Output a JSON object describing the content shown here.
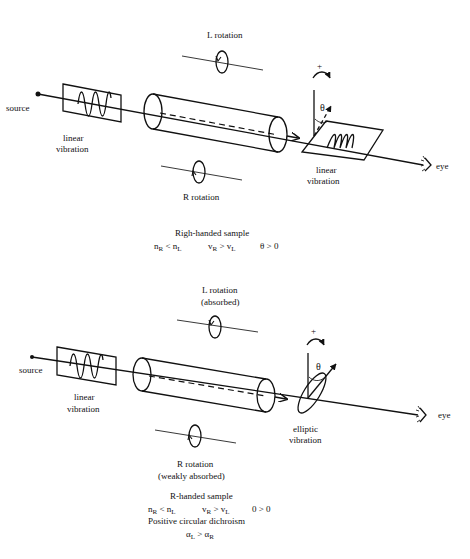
{
  "figure": {
    "panels": [
      {
        "id": "top",
        "title": "Righ-handed sample",
        "labels": {
          "source": "source",
          "input_vibration": [
            "linear",
            "vibration"
          ],
          "l_rotation": [
            "L rotation"
          ],
          "r_rotation": [
            "R rotation"
          ],
          "output_vibration": [
            "linear",
            "vibration"
          ],
          "eye": "eye",
          "plus": "+",
          "theta": "θ"
        },
        "relations": {
          "n": {
            "a": "n",
            "a_sub": "R",
            "op": " < ",
            "b": "n",
            "b_sub": "L"
          },
          "v": {
            "a": "v",
            "a_sub": "R",
            "op": " > ",
            "b": "v",
            "b_sub": "L"
          },
          "theta": "θ > 0"
        }
      },
      {
        "id": "bottom",
        "title": "R-handed sample",
        "labels": {
          "source": "source",
          "input_vibration": [
            "linear",
            "vibration"
          ],
          "l_rotation": [
            "L rotation",
            "(absorbed)"
          ],
          "r_rotation": [
            "R rotation",
            "(weakly absorbed)"
          ],
          "output_vibration": [
            "elliptic",
            "vibration"
          ],
          "eye": "eye",
          "plus": "+",
          "theta": "θ"
        },
        "relations": {
          "n": {
            "a": "n",
            "a_sub": "R",
            "op": " < ",
            "b": "n",
            "b_sub": "L"
          },
          "v": {
            "a": "v",
            "a_sub": "R",
            "op": " > ",
            "b": "v",
            "b_sub": "L"
          },
          "theta": "0 > 0",
          "dichroism": "Positive circular dichroism",
          "alpha": {
            "a": "α",
            "a_sub": "L",
            "op": " > ",
            "b": "α",
            "b_sub": "R"
          }
        }
      }
    ]
  }
}
